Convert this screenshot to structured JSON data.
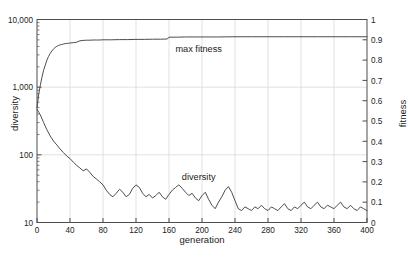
{
  "chart_data": {
    "type": "line",
    "title": "",
    "xlabel": "generation",
    "ylabel": "diversity",
    "y2label": "fitness",
    "xlim": [
      0,
      400
    ],
    "xticks": [
      0,
      40,
      80,
      120,
      160,
      200,
      240,
      280,
      320,
      360,
      400
    ],
    "xticklabels": [
      "0",
      "40",
      "80",
      "120",
      "160",
      "200",
      "240",
      "280",
      "320",
      "360",
      "400"
    ],
    "yscale": "log",
    "ylim": [
      10,
      10000
    ],
    "yticks": [
      10,
      100,
      1000,
      10000
    ],
    "yticklabels": [
      "10",
      "100",
      "1,000",
      "10,000"
    ],
    "y2lim": [
      0,
      1
    ],
    "y2ticks": [
      0,
      0.1,
      0.2,
      0.3,
      0.4,
      0.5,
      0.6,
      0.7,
      0.8,
      0.9,
      1
    ],
    "y2ticklabels": [
      "0",
      "0.1",
      "0.2",
      "0.3",
      "0.4",
      "0.5",
      "0.6",
      "0.7",
      "0.8",
      "0.9",
      "1"
    ],
    "grid": true,
    "legend_position": "inline-annotation",
    "line_color": "#4d4d4d",
    "grid_color": "#d9d9d9",
    "frame_color": "#4d4d4d",
    "annotations": [
      {
        "text": "max fitness",
        "x": 196,
        "y_axis": "right",
        "y": 0.84
      },
      {
        "text": "diversity",
        "x": 196,
        "y_axis": "left",
        "y": 42
      }
    ],
    "series": [
      {
        "name": "max fitness",
        "axis": "right",
        "x": [
          0,
          2,
          4,
          6,
          8,
          10,
          12,
          14,
          16,
          18,
          20,
          22,
          24,
          26,
          28,
          30,
          32,
          34,
          36,
          38,
          40,
          44,
          48,
          52,
          56,
          60,
          64,
          68,
          72,
          76,
          80,
          90,
          100,
          110,
          120,
          130,
          140,
          150,
          158,
          160,
          170,
          180,
          190,
          200,
          220,
          240,
          260,
          280,
          300,
          320,
          340,
          360,
          380,
          400
        ],
        "values": [
          0.565,
          0.63,
          0.675,
          0.715,
          0.75,
          0.775,
          0.8,
          0.818,
          0.833,
          0.845,
          0.855,
          0.862,
          0.868,
          0.872,
          0.875,
          0.877,
          0.879,
          0.881,
          0.882,
          0.883,
          0.884,
          0.886,
          0.888,
          0.895,
          0.897,
          0.898,
          0.898,
          0.899,
          0.899,
          0.899,
          0.9,
          0.9,
          0.901,
          0.901,
          0.902,
          0.902,
          0.903,
          0.903,
          0.904,
          0.913,
          0.913,
          0.914,
          0.914,
          0.914,
          0.914,
          0.915,
          0.915,
          0.915,
          0.915,
          0.915,
          0.915,
          0.915,
          0.915,
          0.915
        ]
      },
      {
        "name": "diversity",
        "axis": "left",
        "x": [
          0,
          4,
          8,
          12,
          16,
          20,
          24,
          28,
          32,
          36,
          40,
          44,
          48,
          52,
          56,
          60,
          64,
          68,
          72,
          76,
          80,
          84,
          88,
          92,
          96,
          100,
          104,
          108,
          112,
          116,
          120,
          124,
          128,
          132,
          136,
          140,
          144,
          148,
          152,
          156,
          160,
          164,
          168,
          172,
          176,
          180,
          184,
          188,
          192,
          196,
          200,
          204,
          208,
          212,
          216,
          220,
          224,
          228,
          232,
          236,
          240,
          244,
          248,
          252,
          256,
          260,
          264,
          268,
          272,
          276,
          280,
          284,
          288,
          292,
          296,
          300,
          304,
          308,
          312,
          316,
          320,
          324,
          328,
          332,
          336,
          340,
          344,
          348,
          352,
          356,
          360,
          364,
          368,
          372,
          376,
          380,
          384,
          388,
          392,
          396,
          400
        ],
        "values": [
          470,
          390,
          300,
          235,
          190,
          160,
          140,
          122,
          108,
          96,
          88,
          78,
          70,
          64,
          58,
          62,
          55,
          48,
          44,
          40,
          36,
          30,
          26,
          24,
          27,
          31,
          28,
          24,
          26,
          32,
          36,
          33,
          27,
          24,
          26,
          23,
          25,
          28,
          24,
          22,
          26,
          30,
          33,
          36,
          32,
          28,
          25,
          27,
          23,
          21,
          25,
          28,
          22,
          18,
          16,
          20,
          24,
          30,
          34,
          28,
          21,
          16,
          15,
          17,
          16,
          15,
          17,
          16,
          18,
          16,
          15,
          17,
          16,
          15,
          17,
          19,
          16,
          15,
          17,
          16,
          18,
          20,
          17,
          16,
          18,
          20,
          17,
          16,
          18,
          17,
          16,
          18,
          20,
          17,
          16,
          18,
          16,
          15,
          17,
          16,
          15
        ]
      }
    ]
  }
}
